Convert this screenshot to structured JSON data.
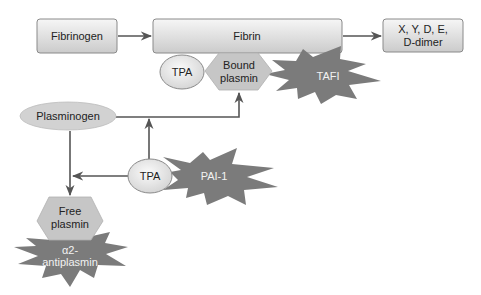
{
  "diagram": {
    "type": "fibrinolysis pathway",
    "nodes": {
      "fibrinogen": {
        "label": "Fibrinogen",
        "shape": "rounded-rect"
      },
      "fibrin": {
        "label": "Fibrin",
        "shape": "rounded-rect"
      },
      "degradation": {
        "line1": "X, Y, D, E,",
        "line2": "D-dimer",
        "shape": "rounded-rect"
      },
      "tpa_top": {
        "label": "TPA",
        "shape": "ellipse"
      },
      "bound_plasmin": {
        "line1": "Bound",
        "line2": "plasmin",
        "shape": "hexagon"
      },
      "tafi": {
        "label": "TAFI",
        "shape": "starburst"
      },
      "plasminogen": {
        "label": "Plasminogen",
        "shape": "ellipse"
      },
      "tpa_mid": {
        "label": "TPA",
        "shape": "ellipse"
      },
      "pai1": {
        "label": "PAI-1",
        "shape": "starburst"
      },
      "free_plasmin": {
        "line1": "Free",
        "line2": "plasmin",
        "shape": "hexagon"
      },
      "antiplasmin": {
        "line1": "α2-",
        "line2": "antiplasmin",
        "shape": "starburst"
      }
    },
    "edges": [
      {
        "from": "Fibrinogen",
        "to": "Fibrin"
      },
      {
        "from": "Fibrin",
        "to": "X, Y, D, E, D-dimer"
      },
      {
        "from": "Plasminogen",
        "to": "Bound plasmin"
      },
      {
        "from": "TPA",
        "to": "Plasminogen-to-Bound plasmin path"
      },
      {
        "from": "TPA",
        "to": "Plasminogen-to-Free plasmin path"
      },
      {
        "from": "Plasminogen",
        "to": "Free plasmin"
      }
    ],
    "colors": {
      "box_fill_top": "#f4f4f4",
      "box_fill_bottom": "#cfcfcf",
      "box_stroke": "#8a8a8a",
      "ellipse_fill": "#d6d6d6",
      "hexagon_fill": "#c4c4c4",
      "star_fill": "#7a7a7a",
      "arrow": "#555555"
    }
  }
}
